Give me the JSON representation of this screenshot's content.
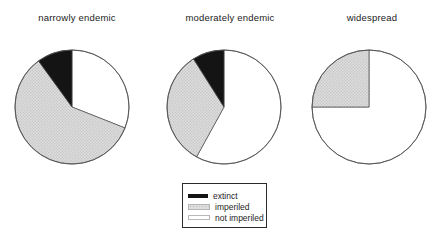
{
  "chart_data": [
    {
      "type": "pie",
      "title": "narrowly endemic",
      "slices": [
        {
          "label": "extinct",
          "value": 10,
          "fill_key": "extinct"
        },
        {
          "label": "imperiled",
          "value": 59,
          "fill_key": "imperiled"
        },
        {
          "label": "not imperiled",
          "value": 31,
          "fill_key": "not_imperiled"
        }
      ]
    },
    {
      "type": "pie",
      "title": "moderately endemic",
      "slices": [
        {
          "label": "extinct",
          "value": 9,
          "fill_key": "extinct"
        },
        {
          "label": "imperiled",
          "value": 33,
          "fill_key": "imperiled"
        },
        {
          "label": "not imperiled",
          "value": 58,
          "fill_key": "not_imperiled"
        }
      ]
    },
    {
      "type": "pie",
      "title": "widespread",
      "slices": [
        {
          "label": "extinct",
          "value": 0,
          "fill_key": "extinct"
        },
        {
          "label": "imperiled",
          "value": 25,
          "fill_key": "imperiled"
        },
        {
          "label": "not imperiled",
          "value": 75,
          "fill_key": "not_imperiled"
        }
      ]
    }
  ],
  "legend": {
    "position": "bottom-center",
    "items": [
      {
        "label": "extinct",
        "swatch": "black"
      },
      {
        "label": "imperiled",
        "swatch": "stipple"
      },
      {
        "label": "not imperiled",
        "swatch": "white-outline"
      }
    ]
  },
  "colors": {
    "extinct": "#141414",
    "imperiled_stipple_bg": "#dedede",
    "imperiled_stipple_dot": "#c3c3c3",
    "not_imperiled": "#ffffff",
    "outline": "#4a4a4a",
    "background": "#ffffff"
  }
}
